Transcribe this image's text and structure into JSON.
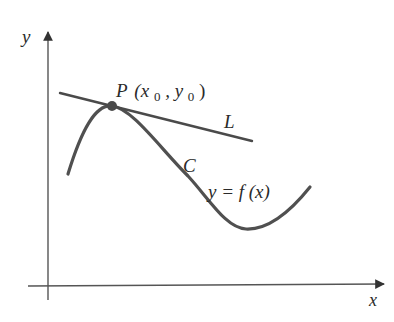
{
  "diagram": {
    "type": "tangent-line-to-curve",
    "axes": {
      "x_label": "x",
      "y_label": "y"
    },
    "point": {
      "name": "P",
      "coords_text": "(x",
      "sub_x": "0",
      "sep": ", y",
      "sub_y": "0",
      "close": ")"
    },
    "tangent_line": {
      "label": "L"
    },
    "curve": {
      "label": "C",
      "equation": "y = f (x)"
    },
    "colors": {
      "axis": "#555555",
      "curve": "#505050",
      "line": "#4a4a4a",
      "point": "#4a4a4a",
      "text": "#2a2a2a",
      "background": "#ffffff"
    }
  }
}
